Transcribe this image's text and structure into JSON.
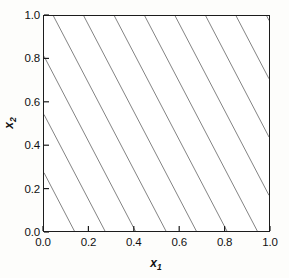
{
  "figure": {
    "background_color": "#fdfdfb",
    "plot_background_color": "#ffffff",
    "axis_color": "#1c1c1c",
    "line_color": "#1c1c1c"
  },
  "labels": {
    "xlabel_base": "x",
    "xlabel_sub": "1",
    "ylabel_base": "x",
    "ylabel_sub": "2"
  },
  "chart_data": {
    "type": "line",
    "title": "",
    "xlabel": "x_1",
    "ylabel": "x_2",
    "xlim": [
      0.0,
      1.0
    ],
    "ylim": [
      0.0,
      1.0
    ],
    "grid": false,
    "legend": null,
    "legend_position": "none",
    "xticks": [
      0.0,
      0.2,
      0.4,
      0.6,
      0.8,
      1.0
    ],
    "xtick_labels": [
      "0.0",
      "0.2",
      "0.4",
      "0.6",
      "0.8",
      "1.0"
    ],
    "yticks": [
      0.0,
      0.2,
      0.4,
      0.6,
      0.8,
      1.0
    ],
    "ytick_labels": [
      "0.0",
      "0.2",
      "0.4",
      "0.6",
      "0.8",
      "1.0"
    ],
    "tick_direction": "in",
    "contour_slope": -2.0,
    "contour_spacing_x": 0.1354,
    "series": [
      {
        "name": "contour-1",
        "x": [
          0.0,
          0.135
        ],
        "y": [
          0.271,
          0.0
        ]
      },
      {
        "name": "contour-2",
        "x": [
          0.0,
          0.271
        ],
        "y": [
          0.542,
          0.0
        ]
      },
      {
        "name": "contour-3",
        "x": [
          0.0,
          0.406
        ],
        "y": [
          0.813,
          0.0
        ]
      },
      {
        "name": "contour-4",
        "x": [
          0.042,
          0.542
        ],
        "y": [
          1.0,
          0.0
        ]
      },
      {
        "name": "contour-5",
        "x": [
          0.177,
          0.677
        ],
        "y": [
          1.0,
          0.0
        ]
      },
      {
        "name": "contour-6",
        "x": [
          0.313,
          0.813
        ],
        "y": [
          1.0,
          0.0
        ]
      },
      {
        "name": "contour-7",
        "x": [
          0.448,
          0.948
        ],
        "y": [
          1.0,
          0.0
        ]
      },
      {
        "name": "contour-8",
        "x": [
          0.583,
          1.0
        ],
        "y": [
          1.0,
          0.166
        ]
      },
      {
        "name": "contour-9",
        "x": [
          0.719,
          1.0
        ],
        "y": [
          1.0,
          0.437
        ]
      },
      {
        "name": "contour-10",
        "x": [
          0.854,
          1.0
        ],
        "y": [
          1.0,
          0.708
        ]
      },
      {
        "name": "contour-11",
        "x": [
          0.99,
          1.0
        ],
        "y": [
          1.0,
          0.979
        ]
      }
    ]
  }
}
